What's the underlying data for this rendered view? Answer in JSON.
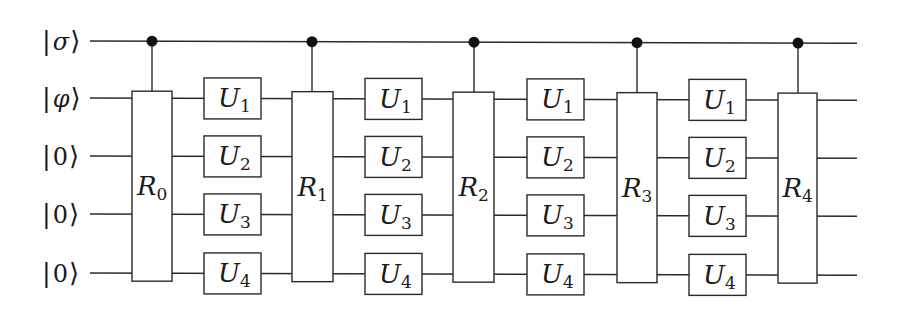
{
  "diagram": {
    "type": "quantum-circuit",
    "qubits": [
      {
        "label": "|σ⟩",
        "bar": "|",
        "symbol": "σ",
        "angle": "⟩",
        "y": 41,
        "role": "control"
      },
      {
        "label": "|φ⟩",
        "bar": "|",
        "symbol": "φ",
        "angle": "⟩",
        "y": 98,
        "role": "target"
      },
      {
        "label": "|0⟩",
        "bar": "|",
        "symbol": "0",
        "angle": "⟩",
        "y": 156,
        "role": "target"
      },
      {
        "label": "|0⟩",
        "bar": "|",
        "symbol": "0",
        "angle": "⟩",
        "y": 214,
        "role": "target"
      },
      {
        "label": "|0⟩",
        "bar": "|",
        "symbol": "0",
        "angle": "⟩",
        "y": 273,
        "role": "target"
      }
    ],
    "wire_start_x": 90,
    "wire_end_x": 857,
    "controlled_gates": [
      {
        "name": "R",
        "sub": "0",
        "x": 132,
        "w": 40,
        "ctrl_x": 152
      },
      {
        "name": "R",
        "sub": "1",
        "x": 292,
        "w": 41,
        "ctrl_x": 312
      },
      {
        "name": "R",
        "sub": "2",
        "x": 453,
        "w": 41,
        "ctrl_x": 474
      },
      {
        "name": "R",
        "sub": "3",
        "x": 617,
        "w": 40,
        "ctrl_x": 637
      },
      {
        "name": "R",
        "sub": "4",
        "x": 778,
        "w": 39,
        "ctrl_x": 798
      }
    ],
    "unitary_columns": [
      {
        "x": 204
      },
      {
        "x": 365
      },
      {
        "x": 527
      },
      {
        "x": 689
      }
    ],
    "unitaries": [
      {
        "name": "U",
        "sub": "1"
      },
      {
        "name": "U",
        "sub": "2"
      },
      {
        "name": "U",
        "sub": "3"
      },
      {
        "name": "U",
        "sub": "4"
      }
    ],
    "colors": {
      "line": "#2a2a2a",
      "control_dot": "#111111",
      "background": "#ffffff"
    }
  }
}
